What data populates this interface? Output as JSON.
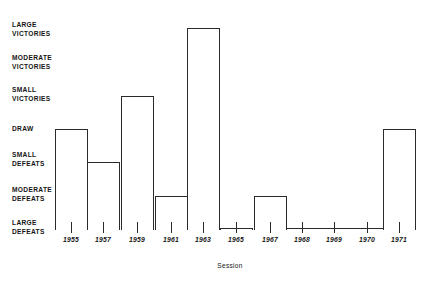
{
  "chart_data": {
    "type": "line",
    "title": "",
    "xlabel": "Session",
    "ylabel": "",
    "grid": false,
    "legend": null,
    "categories": [
      "1955",
      "1957",
      "1959",
      "1961",
      "1963",
      "1965",
      "1967",
      "1968",
      "1969",
      "1970",
      "1971"
    ],
    "y_tick_labels": [
      "LARGE\nVICTORIES",
      "MODERATE\nVICTORIES",
      "SMALL\nVICTORIES",
      "DRAW",
      "SMALL\nDEFEATS",
      "MODERATE\nDEFEATS",
      "LARGE\nDEFEATS"
    ],
    "y_levels": [
      3,
      2,
      1,
      0,
      -1,
      -2,
      -3
    ],
    "ylim": [
      -3,
      3
    ],
    "values": [
      0,
      -1,
      1,
      -2,
      3,
      -3,
      -2,
      -3,
      -3,
      -3,
      0
    ],
    "value_labels": [
      "DRAW",
      "SMALL DEFEATS",
      "SMALL VICTORIES",
      "MODERATE DEFEATS",
      "LARGE VICTORIES",
      "LARGE DEFEATS",
      "MODERATE DEFEATS",
      "LARGE DEFEATS",
      "LARGE DEFEATS",
      "LARGE DEFEATS",
      "DRAW"
    ],
    "style": "step-post",
    "line_color": "#2b2b2b",
    "background": "#ffffff",
    "note": "1969 and 1970 share one continuous step segment at LARGE DEFEATS"
  },
  "axis": {
    "x_caption": "Session",
    "x_ticks": [
      {
        "label": "1955",
        "x": 71
      },
      {
        "label": "1957",
        "x": 103
      },
      {
        "label": "1959",
        "x": 137
      },
      {
        "label": "1961",
        "x": 171
      },
      {
        "label": "1963",
        "x": 203
      },
      {
        "label": "1965",
        "x": 236
      },
      {
        "label": "1967",
        "x": 270
      },
      {
        "label": "1968",
        "x": 302
      },
      {
        "label": "1969",
        "x": 334
      },
      {
        "label": "1970",
        "x": 367
      },
      {
        "label": "1971",
        "x": 399
      }
    ],
    "y_ticks": [
      {
        "line1": "LARGE",
        "line2": "VICTORIES",
        "y": 20
      },
      {
        "line1": "MODERATE",
        "line2": "VICTORIES",
        "y": 53
      },
      {
        "line1": "SMALL",
        "line2": "VICTORIES",
        "y": 85
      },
      {
        "line1": "DRAW",
        "line2": "",
        "y": 124
      },
      {
        "line1": "SMALL",
        "line2": "DEFEATS",
        "y": 150
      },
      {
        "line1": "MODERATE",
        "line2": "DEFEATS",
        "y": 185
      },
      {
        "line1": "LARGE",
        "line2": "DEFEATS",
        "y": 218
      }
    ]
  }
}
